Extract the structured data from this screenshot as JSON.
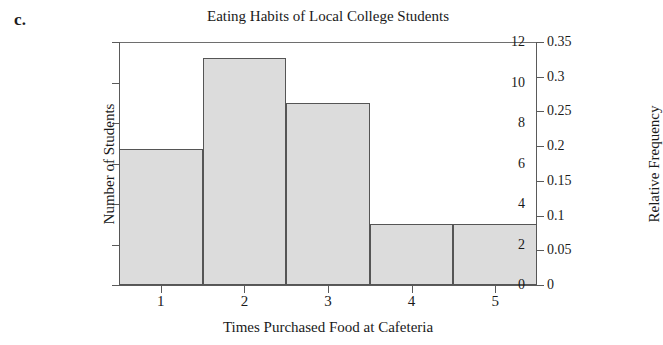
{
  "panel": {
    "letter": "c."
  },
  "chart_data": {
    "type": "bar",
    "title": "Eating Habits of Local College Students",
    "xlabel": "Times Purchased Food at Cafeteria",
    "ylabel": "Number of Students",
    "ylabel_secondary": "Relative Frequency",
    "categories": [
      "1",
      "2",
      "3",
      "4",
      "5"
    ],
    "values": [
      6.7,
      11.2,
      9,
      3,
      3
    ],
    "relative_frequency_values": [
      0.197,
      0.329,
      0.265,
      0.088,
      0.088
    ],
    "ylim": [
      0,
      12
    ],
    "yticks": [
      0,
      2,
      4,
      6,
      8,
      10,
      12
    ],
    "ytick_labels": [
      "0",
      "2",
      "4",
      "6",
      "8",
      "10",
      "12"
    ],
    "ylim_secondary": [
      0,
      0.35
    ],
    "yticks_secondary": [
      0,
      0.05,
      0.1,
      0.15,
      0.2,
      0.25,
      0.3,
      0.35
    ],
    "ytick_labels_secondary": [
      "0",
      "0.05",
      "0.1",
      "0.15",
      "0.2",
      "0.25",
      "0.3",
      "0.35"
    ],
    "xtick_labels": [
      "1",
      "2",
      "3",
      "4",
      "5"
    ],
    "grid": false,
    "legend": false,
    "bar_fill_color": "#dcdcdc",
    "bar_edge_color": "#555555",
    "axis_color": "#5a5a5a",
    "background_color": "#ffffff"
  }
}
